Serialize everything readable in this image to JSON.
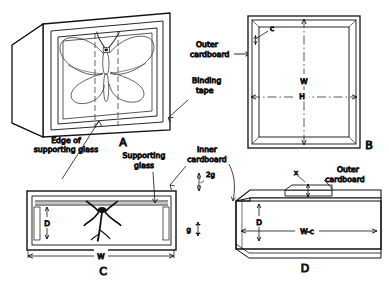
{
  "figure": {
    "ink_color": "#111111",
    "paper_color": "#ffffff",
    "background_fill": "#f2f2f2"
  },
  "panels": {
    "a": {
      "letter": "A",
      "name": "assembled-case-perspective"
    },
    "b": {
      "letter": "B",
      "name": "frame-front-elevation"
    },
    "c": {
      "letter": "C",
      "name": "case-section-with-specimen"
    },
    "d": {
      "letter": "D",
      "name": "inner-cardboard-perspective"
    }
  },
  "labels": {
    "outer_cardboard": "Outer\ncardboard",
    "outer_cardboard_line1": "Outer",
    "outer_cardboard_line2": "cardboard",
    "binding_tape_line1": "Binding",
    "binding_tape_line2": "tape",
    "edge_of_supporting_glass_line1": "Edge of",
    "edge_of_supporting_glass_line2": "supporting glass",
    "supporting_glass_line1": "Supporting",
    "supporting_glass_line2": "glass",
    "inner_cardboard_line1": "Inner",
    "inner_cardboard_line2": "cardboard",
    "outer_cardboard_d_line1": "Outer",
    "outer_cardboard_d_line2": "cardboard"
  },
  "dimensions": {
    "c_small": "c",
    "w_panel_b": "W",
    "h_panel_b": "H",
    "d_panel_c": "D",
    "w_panel_c": "W",
    "two_g": "2g",
    "g": "g",
    "x": "x",
    "d_panel_d": "D",
    "w_minus_c": "W-c"
  }
}
